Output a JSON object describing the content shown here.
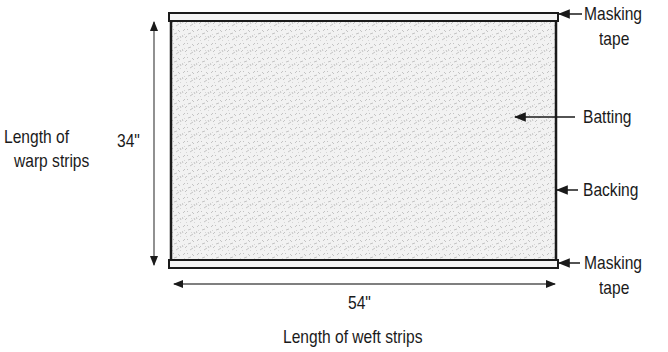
{
  "diagram": {
    "labels": {
      "masking_tape_top_line1": "Masking",
      "masking_tape_top_line2": "tape",
      "batting": "Batting",
      "backing": "Backing",
      "masking_tape_bottom_line1": "Masking",
      "masking_tape_bottom_line2": "tape",
      "warp_length_line1": "Length of",
      "warp_length_line2": "warp strips",
      "warp_dimension": "34\"",
      "weft_dimension": "54\"",
      "weft_length": "Length of weft strips"
    },
    "colors": {
      "line": "#1a1a1a",
      "batting_fill": "#ececec",
      "tape_fill": "#f4f4f4"
    }
  }
}
